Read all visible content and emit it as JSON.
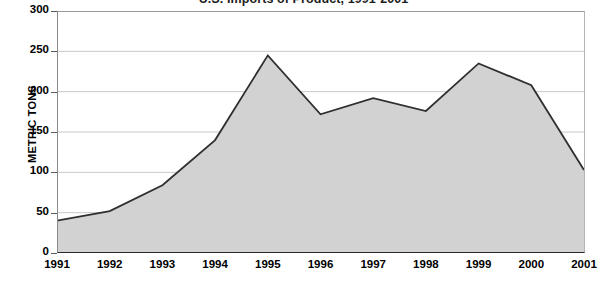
{
  "chart_data": {
    "type": "area",
    "title": "U.S. Imports of Product, 1991-2001",
    "title_visible_fragment": ", 1991-2001",
    "xlabel": "",
    "ylabel": "METRIC TONS",
    "categories": [
      "1991",
      "1992",
      "1993",
      "1994",
      "1995",
      "1996",
      "1997",
      "1998",
      "1999",
      "2000",
      "2001"
    ],
    "values": [
      40,
      52,
      84,
      140,
      245,
      172,
      192,
      176,
      235,
      208,
      103
    ],
    "series": [
      {
        "name": "Metric tons",
        "values": [
          40,
          52,
          84,
          140,
          245,
          172,
          192,
          176,
          235,
          208,
          103
        ]
      }
    ],
    "ylim": [
      0,
      300
    ],
    "xlim": [
      "1991",
      "2001"
    ],
    "y_ticks": [
      0,
      50,
      100,
      150,
      200,
      250,
      300
    ],
    "y_tick_labels": [
      "0",
      "50",
      "100",
      "150",
      "200",
      "250",
      "300"
    ],
    "x_tick_labels": [
      "1991",
      "1992",
      "1993",
      "1994",
      "1995",
      "1996",
      "1997",
      "1998",
      "1999",
      "2000",
      "2001"
    ],
    "grid": true,
    "grid_axis": "y",
    "legend": false,
    "legend_position": "none",
    "annotations": [],
    "colors": {
      "area_fill": "#d2d2d2",
      "line": "#2f2f2f",
      "gridline": "#c8c8c8",
      "axis": "#2b2b2b",
      "text": "#000000",
      "background": "#ffffff"
    }
  }
}
